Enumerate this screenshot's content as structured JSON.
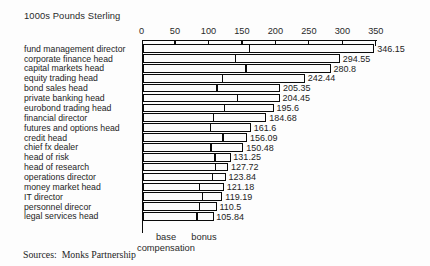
{
  "page": {
    "title": "1000s Pounds Sterling",
    "sources_line": "Sources:  Monks Partnership"
  },
  "legend": {
    "base_label": "base compensation",
    "bonus_label": "bonus"
  },
  "chart_data": {
    "type": "bar",
    "orientation": "horizontal",
    "title": "1000s Pounds Sterling",
    "xlabel": "",
    "ylabel": "",
    "xlim": [
      0,
      350
    ],
    "x_ticks": [
      0,
      50,
      100,
      150,
      200,
      250,
      300,
      350
    ],
    "grid": false,
    "legend_position": "bottom",
    "legend_entries": [
      "base compensation",
      "bonus"
    ],
    "bar_style": "white fill, black outline, black divider between base and bonus segments",
    "categories": [
      "fund management director",
      "corporate finance head",
      "capital markets head",
      "equity trading head",
      "bond sales head",
      "private banking head",
      "eurobond trading head",
      "financial director",
      "futures and options head",
      "credit head",
      "chief fx dealer",
      "head of risk",
      "head of research",
      "operations director",
      "money market head",
      "IT director",
      "personnel direcor",
      "legal services head"
    ],
    "totals": [
      346.15,
      294.55,
      280.8,
      242.44,
      205.35,
      204.45,
      195.6,
      184.68,
      161.6,
      156.09,
      150.48,
      131.25,
      127.72,
      123.84,
      121.18,
      119.19,
      110.5,
      105.84
    ],
    "total_labels": [
      "346.15",
      "294.55",
      "280.8",
      "242.44",
      "205.35",
      "204.45",
      "195.6",
      "184.68",
      "161.6",
      "156.09",
      "150.48",
      "131.25",
      "127.72",
      "123.84",
      "121.18",
      "119.19",
      "110.5",
      "105.84"
    ],
    "series": [
      {
        "name": "base compensation",
        "values": [
          160,
          140,
          155,
          120,
          112,
          142,
          123,
          107,
          102,
          121,
          103,
          109,
          110,
          105,
          86,
          90,
          86,
          82
        ],
        "note": "estimated from divider positions; not labeled in chart"
      },
      {
        "name": "bonus",
        "values": [
          186.15,
          154.55,
          125.8,
          122.44,
          93.35,
          62.45,
          72.6,
          77.68,
          59.6,
          35.09,
          47.48,
          22.25,
          17.72,
          18.84,
          35.18,
          29.19,
          24.5,
          23.84
        ],
        "note": "total minus estimated base"
      }
    ]
  }
}
